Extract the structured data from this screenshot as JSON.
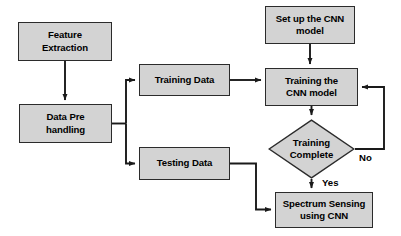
{
  "diagram": {
    "type": "flowchart",
    "colors": {
      "node_fill": "#d3d3d3",
      "node_border": "#2b2b2b",
      "edge": "#1a1a1a",
      "text": "#000000",
      "background": "#ffffff"
    },
    "nodes": [
      {
        "id": "feature-extraction",
        "label": "Feature\nExtraction",
        "shape": "rectangle",
        "x": 18,
        "y": 22,
        "w": 94,
        "h": 39
      },
      {
        "id": "data-pre-handling",
        "label": "Data Pre\nhandling",
        "shape": "rectangle",
        "x": 19,
        "y": 104,
        "w": 93,
        "h": 39
      },
      {
        "id": "training-data",
        "label": "Training Data",
        "shape": "rectangle",
        "x": 139,
        "y": 64,
        "w": 91,
        "h": 32
      },
      {
        "id": "testing-data",
        "label": "Testing Data",
        "shape": "rectangle",
        "x": 139,
        "y": 147,
        "w": 91,
        "h": 33
      },
      {
        "id": "setup-cnn-model",
        "label": "Set up the CNN\nmodel",
        "shape": "rectangle",
        "x": 265,
        "y": 6,
        "w": 90,
        "h": 38
      },
      {
        "id": "training-cnn-model",
        "label": "Training the\nCNN model",
        "shape": "rectangle",
        "x": 265,
        "y": 68,
        "w": 93,
        "h": 38
      },
      {
        "id": "training-complete",
        "label": "Training\nComplete",
        "shape": "diamond",
        "x": 268,
        "y": 119,
        "w": 87,
        "h": 60
      },
      {
        "id": "spectrum-sensing",
        "label": "Spectrum Sensing\nusing CNN",
        "shape": "rectangle",
        "x": 275,
        "y": 192,
        "w": 98,
        "h": 36
      }
    ],
    "edge_labels": [
      {
        "id": "no-label",
        "text": "No",
        "x": 359,
        "y": 152
      },
      {
        "id": "yes-label",
        "text": "Yes",
        "x": 322,
        "y": 177
      }
    ],
    "edges": [
      {
        "id": "feature-to-datapre",
        "from": "feature-extraction",
        "to": "data-pre-handling",
        "label": ""
      },
      {
        "id": "datapre-to-training-data",
        "from": "data-pre-handling",
        "to": "training-data",
        "label": ""
      },
      {
        "id": "datapre-to-testing-data",
        "from": "data-pre-handling",
        "to": "testing-data",
        "label": ""
      },
      {
        "id": "training-data-to-training-cnn",
        "from": "training-data",
        "to": "training-cnn-model",
        "label": ""
      },
      {
        "id": "setup-to-training-cnn",
        "from": "setup-cnn-model",
        "to": "training-cnn-model",
        "label": ""
      },
      {
        "id": "training-cnn-to-decision",
        "from": "training-cnn-model",
        "to": "training-complete",
        "label": ""
      },
      {
        "id": "decision-no-loop",
        "from": "training-complete",
        "to": "training-cnn-model",
        "label": "No"
      },
      {
        "id": "decision-yes-to-spectrum",
        "from": "training-complete",
        "to": "spectrum-sensing",
        "label": "Yes"
      },
      {
        "id": "testing-data-to-spectrum",
        "from": "testing-data",
        "to": "spectrum-sensing",
        "label": ""
      }
    ]
  }
}
